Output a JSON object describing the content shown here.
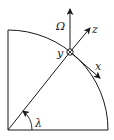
{
  "diagram": {
    "labels": {
      "omega": "Ω",
      "z_axis": "z",
      "y_axis": "y",
      "x_axis": "x",
      "latitude": "λ"
    },
    "colors": {
      "stroke": "#1a1a1a",
      "background": "#ffffff"
    },
    "elements": [
      "quarter-circle Earth section",
      "radius line at latitude λ",
      "rotation axis Ω (vertical)",
      "local z axis (radial outward)",
      "local x axis (tangent, southward)",
      "local y axis (into page, ⊗)"
    ]
  }
}
